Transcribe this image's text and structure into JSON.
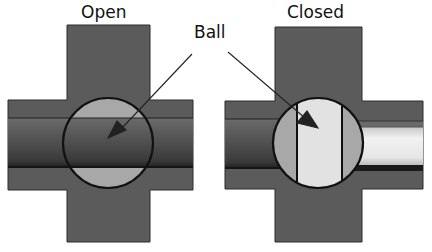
{
  "diagram": {
    "labels": {
      "open": "Open",
      "closed": "Closed",
      "ball": "Ball"
    },
    "colors": {
      "body": "#5a5a5a",
      "body_outline": "#2a2a2a",
      "pipe_dark": "#4a4a4a",
      "ball_fill": "#a9a9a9",
      "ball_bore_light": "#e3e3e3",
      "pipe_light": "#e8e8e8",
      "outline": "#111111"
    },
    "valves": [
      {
        "state": "open",
        "bore": "aligned with pipe, flow passes"
      },
      {
        "state": "closed",
        "bore": "rotated 90 degrees, flow blocked"
      }
    ]
  }
}
